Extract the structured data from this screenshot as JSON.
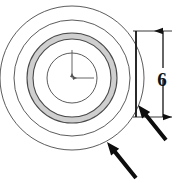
{
  "figure": {
    "background_color": "#ffffff",
    "line_color": "#3a3a3a",
    "heavy_line_color": "#111111",
    "shade_color": "#cfcfcf",
    "fill_color": "#ffffff",
    "width": 175,
    "height": 181
  },
  "disc": {
    "center": {
      "x": 72,
      "y": 78
    },
    "rings": [
      {
        "name": "outer-edge-circle",
        "radius": 72,
        "fill": "#ffffff"
      },
      {
        "name": "shade-ring-outer-circle",
        "radius": 58,
        "fill": "#ffffff"
      },
      {
        "name": "shade-ring-inner-circle",
        "radius": 45,
        "fill": "#cfcfcf"
      },
      {
        "name": "bore-outer-circle",
        "radius": 39,
        "fill": "#ffffff"
      },
      {
        "name": "bore-circle",
        "radius": 25,
        "fill": "#ffffff"
      }
    ]
  },
  "center_mark": {
    "name": "center-crosshair",
    "vertical_length": 28,
    "horizontal_length": 22
  },
  "dimension": {
    "label": "6",
    "label_x": 162,
    "label_y": 86,
    "extension_top_y": 31,
    "extension_bottom_y": 117,
    "extension_left_x": 133,
    "extension_right_x": 172,
    "witness_x": 136,
    "dim_line_x": 163,
    "arrow_style": "filled-triangle"
  },
  "leaders": [
    {
      "name": "leader-arrow-edge-thickness",
      "tip_x": 138,
      "tip_y": 105,
      "tail_x": 166,
      "tail_y": 140
    },
    {
      "name": "leader-arrow-outer-diameter",
      "tip_x": 107,
      "tip_y": 142,
      "tail_x": 136,
      "tail_y": 178
    }
  ]
}
